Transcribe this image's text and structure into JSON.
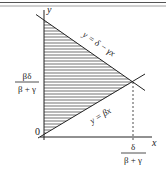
{
  "diagram": {
    "axes": {
      "x_label": "x",
      "y_label": "y",
      "origin_label": "0"
    },
    "lines": [
      {
        "id": "upper",
        "equation": "y = δ − γx"
      },
      {
        "id": "lower",
        "equation": "y = βx"
      }
    ],
    "intersection": {
      "x_label_num": "δ",
      "x_label_den": "β + γ",
      "y_label_num": "βδ",
      "y_label_den": "β + γ"
    },
    "region": {
      "fill": "hatched",
      "description": "triangle between y-axis, y = δ − γx and y = βx"
    },
    "colors": {
      "ink": "#222222",
      "rule": "#555555",
      "background": "#ffffff"
    }
  }
}
